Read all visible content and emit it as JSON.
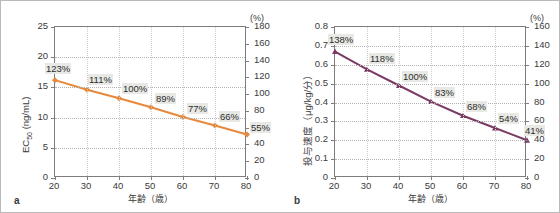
{
  "figure": {
    "panels": [
      {
        "letter": "a",
        "y_left_title": "EC50 (ng/mL)",
        "y_left_title_main": "EC",
        "y_left_title_sub": "50",
        "y_left_title_rest": " (ng/mL)",
        "y_right_unit": "(%)",
        "x_title": "年齢（歳）"
      },
      {
        "letter": "b",
        "y_left_title": "投与速度（μg/kg/分）",
        "y_right_unit": "(%)",
        "x_title": "年齢（歳）"
      }
    ]
  },
  "chart_data": [
    {
      "type": "line",
      "panel": "a",
      "title": "",
      "xlabel": "年齢（歳）",
      "ylabel": "EC50 (ng/mL)",
      "ylabel_right": "(%)",
      "xlim": [
        20,
        80
      ],
      "ylim": [
        0,
        25
      ],
      "ylim_right": [
        0,
        180
      ],
      "xticks": [
        20,
        30,
        40,
        50,
        60,
        70,
        80
      ],
      "yticks": [
        0,
        5,
        10,
        15,
        20,
        25
      ],
      "yticks_right": [
        0,
        20,
        40,
        60,
        80,
        100,
        120,
        140,
        160,
        180
      ],
      "grid": true,
      "legend": "none",
      "series_color": "#E8883A",
      "marker": "diamond",
      "x": [
        20,
        30,
        40,
        50,
        60,
        70,
        80
      ],
      "values": [
        16.2,
        14.6,
        13.2,
        11.7,
        10.1,
        8.7,
        7.2
      ],
      "data_labels": [
        "123%",
        "111%",
        "100%",
        "89%",
        "77%",
        "66%",
        "55%"
      ],
      "percent_values": [
        123,
        111,
        100,
        89,
        77,
        66,
        55
      ]
    },
    {
      "type": "line",
      "panel": "b",
      "title": "",
      "xlabel": "年齢（歳）",
      "ylabel": "投与速度（μg/kg/分）",
      "ylabel_right": "(%)",
      "xlim": [
        20,
        80
      ],
      "ylim": [
        0,
        0.8
      ],
      "ylim_right": [
        0,
        160
      ],
      "xticks": [
        20,
        30,
        40,
        50,
        60,
        70,
        80
      ],
      "yticks": [
        "0",
        "0.1",
        "0.2",
        "0.3",
        "0.4",
        "0.5",
        "0.6",
        "0.7",
        "0.8"
      ],
      "yticks_right": [
        0,
        20,
        40,
        60,
        80,
        100,
        120,
        140,
        160
      ],
      "grid": true,
      "legend": "none",
      "series_color": "#7B3A62",
      "marker": "triangle",
      "x": [
        20,
        30,
        40,
        50,
        60,
        70,
        80
      ],
      "values": [
        0.67,
        0.575,
        0.49,
        0.405,
        0.33,
        0.265,
        0.2
      ],
      "data_labels": [
        "138%",
        "118%",
        "100%",
        "83%",
        "68%",
        "54%",
        "41%"
      ],
      "percent_values": [
        138,
        118,
        100,
        83,
        68,
        54,
        41
      ]
    }
  ]
}
